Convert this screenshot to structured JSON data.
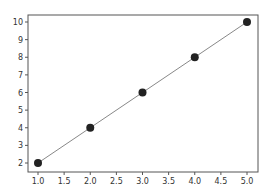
{
  "chart_data": {
    "type": "line",
    "title": "",
    "xlabel": "",
    "ylabel": "",
    "x": [
      1,
      2,
      3,
      4,
      5
    ],
    "series": [
      {
        "name": "",
        "values": [
          2,
          4,
          6,
          8,
          10
        ],
        "color": "#222222",
        "line_color": "#888888",
        "marker": "circle"
      }
    ],
    "xlim": [
      0.8,
      5.2
    ],
    "ylim": [
      1.6,
      10.4
    ],
    "xticks": [
      "1.0",
      "1.5",
      "2.0",
      "2.5",
      "3.0",
      "3.5",
      "4.0",
      "4.5",
      "5.0"
    ],
    "yticks": [
      "2",
      "3",
      "4",
      "5",
      "6",
      "7",
      "8",
      "9",
      "10"
    ],
    "grid": false,
    "legend": null
  }
}
